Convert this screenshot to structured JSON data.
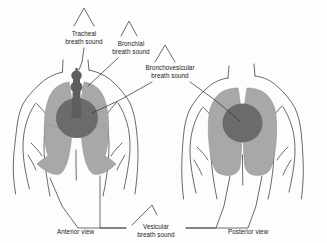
{
  "figure": {
    "background_color": "#fdfdfd",
    "line_color": "#2b2b2b",
    "lung_fill": "#a8a8a8",
    "bronchovesicular_fill": "#6b6b6b",
    "trachea_fill": "#5e5e5e"
  },
  "labels": {
    "tracheal": {
      "line1": "Tracheal",
      "line2": "breath sound"
    },
    "bronchial": {
      "line1": "Bronchial",
      "line2": "breath sound"
    },
    "bronchovesicular": {
      "line1": "Bronchovesicular",
      "line2": "breath sound"
    },
    "vesicular": {
      "line1": "Vesicular",
      "line2": "breath sound"
    }
  },
  "views": {
    "anterior": "Anterior view",
    "posterior": "Posterior view"
  }
}
